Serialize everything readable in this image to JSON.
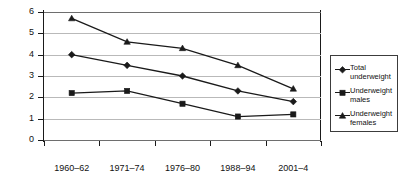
{
  "chart_data": {
    "type": "line",
    "title": "",
    "subtitle": "",
    "xlabel": "",
    "ylabel": "",
    "categories": [
      "1960–62",
      "1971–74",
      "1976–80",
      "1988–94",
      "2001–4"
    ],
    "ylim": [
      0,
      6
    ],
    "yticks": [
      0,
      1,
      2,
      3,
      4,
      5,
      6
    ],
    "ytick_labels": [
      "0",
      "1",
      "2",
      "3",
      "4",
      "5",
      "6"
    ],
    "grid": true,
    "legend_position": "right",
    "series": [
      {
        "name": "Total underweight",
        "label_line1": "Total",
        "label_line2": "underweight",
        "marker": "diamond",
        "color": "#1a1a1a",
        "values": [
          4.0,
          3.5,
          3.0,
          2.3,
          1.8
        ]
      },
      {
        "name": "Underweight males",
        "label_line1": "Underweight",
        "label_line2": "males",
        "marker": "square",
        "color": "#1a1a1a",
        "values": [
          2.2,
          2.3,
          1.7,
          1.1,
          1.2
        ]
      },
      {
        "name": "Underweight females",
        "label_line1": "Underweight",
        "label_line2": "females",
        "marker": "triangle",
        "color": "#1a1a1a",
        "values": [
          5.7,
          4.6,
          4.3,
          3.5,
          2.4
        ]
      }
    ]
  },
  "colors": {
    "series": "#1a1a1a",
    "gridline": "#b9b9b9",
    "axis": "#1a1a1a",
    "legend_border": "#3c3c3c",
    "background": "#ffffff"
  }
}
